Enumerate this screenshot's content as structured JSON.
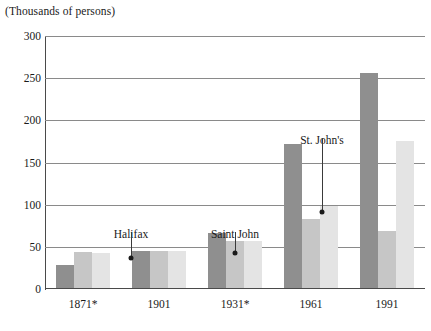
{
  "chart_data": {
    "type": "bar",
    "title": "",
    "subtitle": "",
    "unit_caption": "(Thousands of persons)",
    "xlabel": "",
    "ylabel": "",
    "ylim": [
      0,
      300
    ],
    "y_ticks": [
      0,
      50,
      100,
      150,
      200,
      250,
      300
    ],
    "y_tick_labels": [
      "0",
      "50",
      "100",
      "150",
      "200",
      "250",
      "300"
    ],
    "grid": true,
    "legend_position": "none",
    "categories": [
      "1871*",
      "1901",
      "1931*",
      "1961",
      "1991"
    ],
    "series": [
      {
        "name": "Halifax",
        "color": "#8f8f8f",
        "values": [
          28,
          45,
          66,
          172,
          256
        ]
      },
      {
        "name": "Saint John",
        "color": "#c6c6c6",
        "values": [
          44,
          45,
          57,
          83,
          69
        ]
      },
      {
        "name": "St. John's",
        "color": "#e4e4e4",
        "values": [
          43,
          45,
          57,
          99,
          175
        ]
      }
    ],
    "annotations": [
      {
        "text": "Halifax",
        "target_category": "1871*",
        "target_series": "Halifax",
        "label_x": 131,
        "label_y": 228,
        "line_top": 232,
        "line_bottom": 258,
        "dot_x": 131,
        "dot_y": 258
      },
      {
        "text": "Saint John",
        "target_category": "1931*",
        "target_series": "Saint John",
        "label_x": 235,
        "label_y": 228,
        "line_top": 232,
        "line_bottom": 253,
        "dot_x": 235,
        "dot_y": 253
      },
      {
        "text": "St. John's",
        "target_category": "1961",
        "target_series": "St. John's",
        "label_x": 322,
        "label_y": 134,
        "line_top": 138,
        "line_bottom": 212,
        "dot_x": 322,
        "dot_y": 212
      }
    ]
  }
}
